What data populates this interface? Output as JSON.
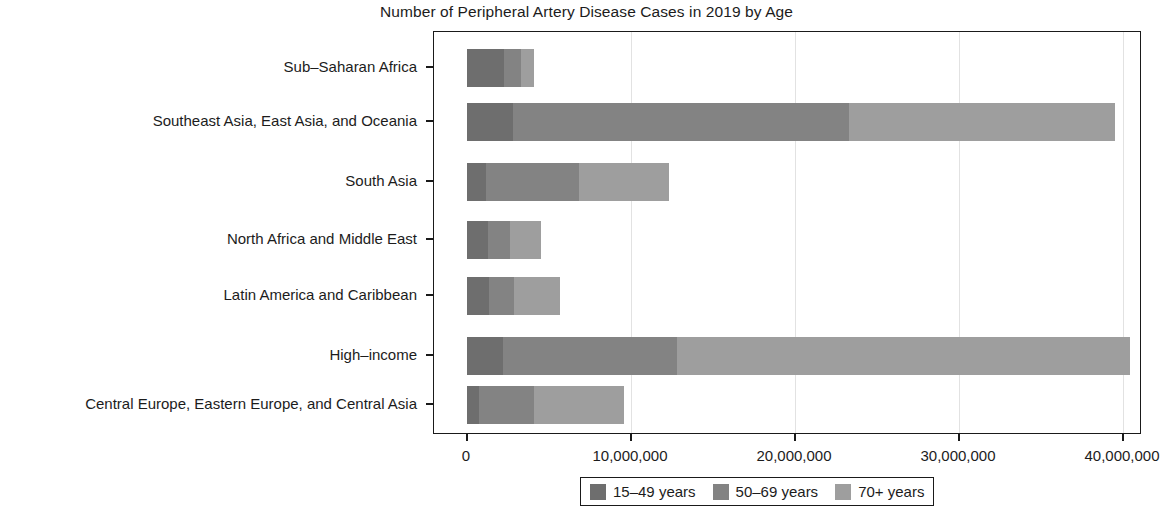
{
  "chart_data": {
    "type": "bar",
    "orientation": "horizontal",
    "stacked": true,
    "title": "Number of Peripheral Artery Disease Cases in 2019 by Age",
    "xlabel": "",
    "ylabel": "",
    "grid": true,
    "legend_position": "bottom",
    "xlim": [
      0,
      42700000
    ],
    "xticks": [
      0,
      10000000,
      20000000,
      30000000,
      40000000
    ],
    "xtick_labels": [
      "0",
      "10,000,000",
      "20,000,000",
      "30,000,000",
      "40,000,000"
    ],
    "categories": [
      "Sub-Saharan Africa",
      "Southeast Asia, East Asia, and Oceania",
      "South Asia",
      "North Africa and Middle East",
      "Latin America and Caribbean",
      "High-income",
      "Central Europe, Eastern Europe, and Central Asia"
    ],
    "series": [
      {
        "name": "15-49 years",
        "color": "#6e6e6e",
        "values": [
          2260000,
          2800000,
          1160000,
          1280000,
          1340000,
          2200000,
          730000
        ]
      },
      {
        "name": "50-69 years",
        "color": "#838383",
        "values": [
          1040000,
          20500000,
          5670000,
          1340000,
          1530000,
          10600000,
          3350000
        ]
      },
      {
        "name": "70+ years",
        "color": "#9e9e9e",
        "values": [
          790000,
          16200000,
          5490000,
          1890000,
          2800000,
          27600000,
          5490000
        ]
      }
    ],
    "totals": [
      4090000,
      39500000,
      12320000,
      4510000,
      5670000,
      40400000,
      9570000
    ]
  },
  "legend": {
    "items": [
      {
        "label": "15–49 years",
        "color": "#6e6e6e"
      },
      {
        "label": "50–69 years",
        "color": "#838383"
      },
      {
        "label": "70+ years",
        "color": "#9e9e9e"
      }
    ]
  },
  "axis": {
    "y_labels": [
      "Sub–Saharan Africa",
      "Southeast Asia, East Asia, and Oceania",
      "South Asia",
      "North Africa and Middle East",
      "Latin America and Caribbean",
      "High–income",
      "Central Europe, Eastern Europe, and Central Asia"
    ],
    "x_labels": [
      "0",
      "10,000,000",
      "20,000,000",
      "30,000,000",
      "40,000,000"
    ]
  }
}
